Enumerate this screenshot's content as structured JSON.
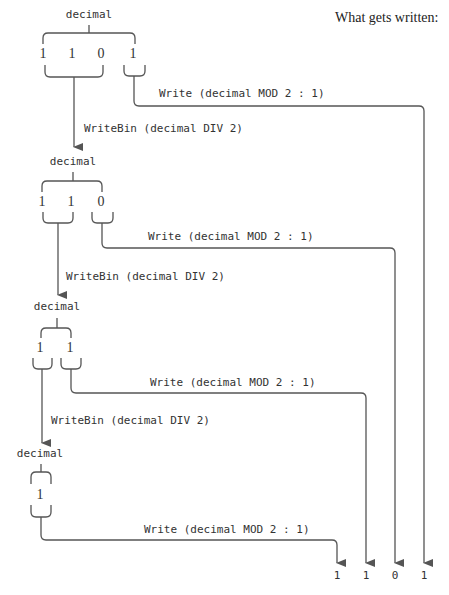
{
  "header": {
    "title": "What gets written:"
  },
  "levels": [
    {
      "label": "decimal",
      "digits": [
        "1",
        "1",
        "0",
        "1"
      ],
      "write_label": "Write (decimal MOD 2 : 1)",
      "call_label": "WriteBin (decimal DIV 2)"
    },
    {
      "label": "decimal",
      "digits": [
        "1",
        "1",
        "0"
      ],
      "write_label": "Write (decimal MOD 2 : 1)",
      "call_label": "WriteBin (decimal DIV 2)"
    },
    {
      "label": "decimal",
      "digits": [
        "1",
        "1"
      ],
      "write_label": "Write (decimal MOD 2 : 1)",
      "call_label": "WriteBin (decimal DIV 2)"
    },
    {
      "label": "decimal",
      "digits": [
        "1"
      ],
      "write_label": "Write (decimal MOD 2 : 1)"
    }
  ],
  "output": {
    "digits": [
      "1",
      "1",
      "0",
      "1"
    ]
  },
  "colors": {
    "line": "#555555",
    "text": "#333333",
    "background": "#ffffff"
  }
}
